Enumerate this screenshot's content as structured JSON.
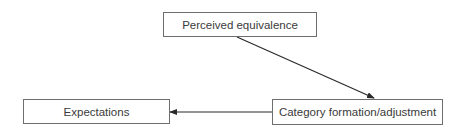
{
  "diagram": {
    "nodes": [
      {
        "id": "perceived",
        "label": "Perceived equivalence"
      },
      {
        "id": "category",
        "label": "Category formation/adjustment"
      },
      {
        "id": "expectations",
        "label": "Expectations"
      }
    ],
    "edges": [
      {
        "from": "perceived",
        "to": "category"
      },
      {
        "from": "category",
        "to": "expectations"
      }
    ],
    "colors": {
      "border": "#6e6e6e",
      "arrow": "#2a2a2a",
      "text": "#3a3a3a"
    }
  }
}
